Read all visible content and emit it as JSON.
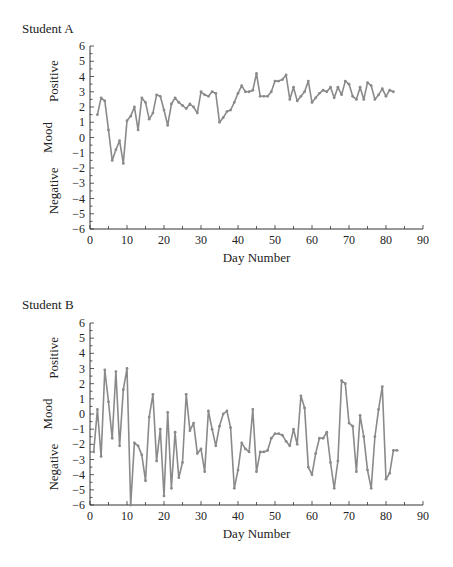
{
  "chart_data": [
    {
      "type": "line",
      "title": "Student A",
      "xlabel": "Day Number",
      "ylabel": "Mood",
      "ylabel_positive": "Positive",
      "ylabel_negative": "Negative",
      "xlim": [
        0,
        90
      ],
      "ylim": [
        -6,
        6
      ],
      "xticks": [
        0,
        10,
        20,
        30,
        40,
        50,
        60,
        70,
        80,
        90
      ],
      "yticks": [
        6,
        5,
        4,
        3,
        2,
        1,
        0,
        -1,
        -2,
        -3,
        -4,
        -5,
        -6
      ],
      "grid": false,
      "legend": null,
      "series": [
        {
          "name": "Student A",
          "color": "#8a8a8a",
          "x": [
            2,
            3,
            4,
            5,
            6,
            7,
            8,
            9,
            10,
            11,
            12,
            13,
            14,
            15,
            16,
            17,
            18,
            19,
            20,
            21,
            22,
            23,
            24,
            25,
            26,
            27,
            28,
            29,
            30,
            31,
            32,
            33,
            34,
            35,
            36,
            37,
            38,
            39,
            40,
            41,
            42,
            43,
            44,
            45,
            46,
            47,
            48,
            49,
            50,
            51,
            52,
            53,
            54,
            55,
            56,
            57,
            58,
            59,
            60,
            61,
            62,
            63,
            64,
            65,
            66,
            67,
            68,
            69,
            70,
            71,
            72,
            73,
            74,
            75,
            76,
            77,
            78,
            79,
            80,
            81,
            82
          ],
          "values": [
            1.5,
            2.6,
            2.4,
            0.5,
            -1.5,
            -0.8,
            -0.2,
            -1.7,
            1.1,
            1.4,
            2.0,
            0.5,
            2.6,
            2.3,
            1.2,
            1.6,
            2.8,
            2.7,
            1.8,
            0.8,
            2.2,
            2.6,
            2.3,
            2.1,
            1.9,
            2.2,
            2.0,
            1.6,
            3.0,
            2.8,
            2.7,
            3.0,
            2.9,
            1.0,
            1.3,
            1.7,
            1.8,
            2.3,
            2.9,
            3.4,
            3.0,
            3.0,
            3.1,
            4.2,
            2.7,
            2.7,
            2.7,
            3.0,
            3.7,
            3.7,
            3.8,
            4.1,
            2.5,
            3.3,
            2.4,
            2.7,
            3.0,
            3.7,
            2.3,
            2.6,
            2.9,
            3.1,
            3.0,
            3.3,
            2.6,
            3.3,
            2.8,
            3.7,
            3.5,
            2.7,
            2.5,
            3.3,
            2.5,
            3.6,
            3.4,
            2.5,
            2.8,
            3.2,
            2.7,
            3.1,
            3.0
          ]
        }
      ]
    },
    {
      "type": "line",
      "title": "Student B",
      "xlabel": "Day Number",
      "ylabel": "Mood",
      "ylabel_positive": "Positive",
      "ylabel_negative": "Negative",
      "xlim": [
        0,
        90
      ],
      "ylim": [
        -6,
        6
      ],
      "xticks": [
        0,
        10,
        20,
        30,
        40,
        50,
        60,
        70,
        80,
        90
      ],
      "yticks": [
        6,
        5,
        4,
        3,
        2,
        1,
        0,
        -1,
        -2,
        -3,
        -4,
        -5,
        -6
      ],
      "grid": false,
      "legend": null,
      "series": [
        {
          "name": "Student B",
          "color": "#8a8a8a",
          "x": [
            1,
            2,
            3,
            4,
            5,
            6,
            7,
            8,
            9,
            10,
            11,
            12,
            13,
            14,
            15,
            16,
            17,
            18,
            19,
            20,
            21,
            22,
            23,
            24,
            25,
            26,
            27,
            28,
            29,
            30,
            31,
            32,
            33,
            34,
            35,
            36,
            37,
            38,
            39,
            40,
            41,
            42,
            43,
            44,
            45,
            46,
            47,
            48,
            49,
            50,
            51,
            52,
            53,
            54,
            55,
            56,
            57,
            58,
            59,
            60,
            61,
            62,
            63,
            64,
            65,
            66,
            67,
            68,
            69,
            70,
            71,
            72,
            73,
            74,
            75,
            76,
            77,
            78,
            79,
            80,
            81,
            82,
            83
          ],
          "values": [
            -2.5,
            0.3,
            -2.8,
            2.9,
            0.8,
            -1.6,
            2.8,
            -2.1,
            1.6,
            3.0,
            -6.0,
            -1.9,
            -2.1,
            -2.7,
            -4.4,
            -0.2,
            1.3,
            -3.1,
            -1.0,
            -5.4,
            0.1,
            -4.9,
            -1.2,
            -4.2,
            -3.2,
            1.3,
            -1.1,
            -0.6,
            -2.6,
            -2.3,
            -3.8,
            0.2,
            -1.0,
            -2.1,
            -0.8,
            0.0,
            0.2,
            -0.9,
            -4.9,
            -3.7,
            -1.9,
            -2.3,
            -2.5,
            0.3,
            -3.8,
            -2.5,
            -2.5,
            -2.4,
            -1.6,
            -1.3,
            -1.3,
            -1.4,
            -1.8,
            -2.1,
            -1.0,
            -2.0,
            1.2,
            0.4,
            -3.5,
            -4.0,
            -2.6,
            -1.6,
            -1.6,
            -1.2,
            -3.2,
            -4.9,
            -3.1,
            2.2,
            2.0,
            -0.6,
            -0.8,
            -3.8,
            -0.1,
            -1.5,
            -3.7,
            -4.9,
            -1.5,
            0.3,
            1.8,
            -4.3,
            -3.9,
            -2.4,
            -2.4
          ]
        }
      ]
    }
  ],
  "panels": {
    "a": {
      "title": "Student A"
    },
    "b": {
      "title": "Student B"
    }
  },
  "axis_labels": {
    "x": "Day Number",
    "y": "Mood",
    "positive": "Positive",
    "negative": "Negative"
  },
  "style": {
    "line_color": "#8a8a8a",
    "axis_color": "#333333"
  }
}
